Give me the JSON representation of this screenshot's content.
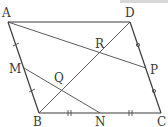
{
  "diagram": {
    "type": "parallelogram-geometry",
    "points": {
      "A": {
        "label": "A",
        "x": 8,
        "y": 22
      },
      "D": {
        "label": "D",
        "x": 130,
        "y": 22
      },
      "B": {
        "label": "B",
        "x": 39,
        "y": 113
      },
      "C": {
        "label": "C",
        "x": 161,
        "y": 113
      },
      "M": {
        "label": "M",
        "x": 24,
        "y": 68
      },
      "P": {
        "label": "P",
        "x": 146,
        "y": 68
      },
      "N": {
        "label": "N",
        "x": 100,
        "y": 113
      },
      "Q": {
        "label": "Q",
        "x": 60,
        "y": 79
      },
      "R": {
        "label": "R",
        "x": 115,
        "y": 45
      }
    },
    "segments": [
      {
        "from": "A",
        "to": "D"
      },
      {
        "from": "D",
        "to": "C"
      },
      {
        "from": "C",
        "to": "B"
      },
      {
        "from": "B",
        "to": "A"
      },
      {
        "from": "A",
        "to": "P"
      },
      {
        "from": "D",
        "to": "B"
      },
      {
        "from": "M",
        "to": "N"
      }
    ],
    "equal_marks": {
      "AM_MB": "single-tick",
      "BN_NC": "double-tick",
      "DP_PC": "circle"
    }
  }
}
